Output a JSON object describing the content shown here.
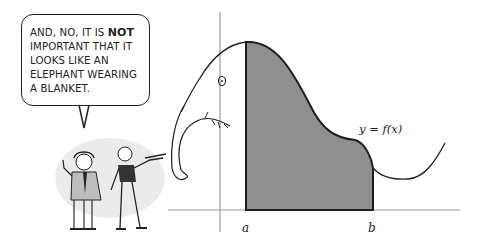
{
  "speech_bubble": {
    "line1_prefix": "AND, NO, IT IS ",
    "line1_emphasis": "NOT",
    "line2": "IMPORTANT THAT IT",
    "line3": "LOOKS LIKE AN",
    "line4": "ELEPHANT WEARING",
    "line5": "A BLANKET."
  },
  "graph": {
    "function_label": "y = f(x)",
    "lower_bound_label": "a",
    "upper_bound_label": "b",
    "shade_color": "#8f8f8f",
    "axis_color": "#9a9a9a",
    "curve_color": "#1e1e1e"
  },
  "characters": {
    "count": 2,
    "description": "two cartoon figures, one in a suit raising a hand, one pointing a stick at the graph"
  }
}
